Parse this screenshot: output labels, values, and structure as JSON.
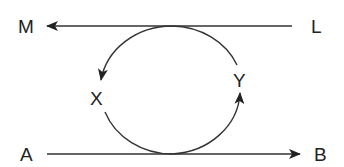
{
  "diagram": {
    "labels": {
      "M": "M",
      "L": "L",
      "X": "X",
      "Y": "Y",
      "A": "A",
      "B": "B"
    },
    "edges": [
      {
        "from": "L",
        "to": "M",
        "type": "straight-arrow"
      },
      {
        "from": "A",
        "to": "B",
        "type": "straight-arrow"
      },
      {
        "from": "top-tangent",
        "to": "X",
        "type": "curved-arrow"
      },
      {
        "from": "bottom-tangent",
        "to": "Y",
        "type": "curved-arrow"
      }
    ],
    "colors": {
      "stroke": "#333333",
      "text": "#222222",
      "background": "#ffffff"
    }
  }
}
